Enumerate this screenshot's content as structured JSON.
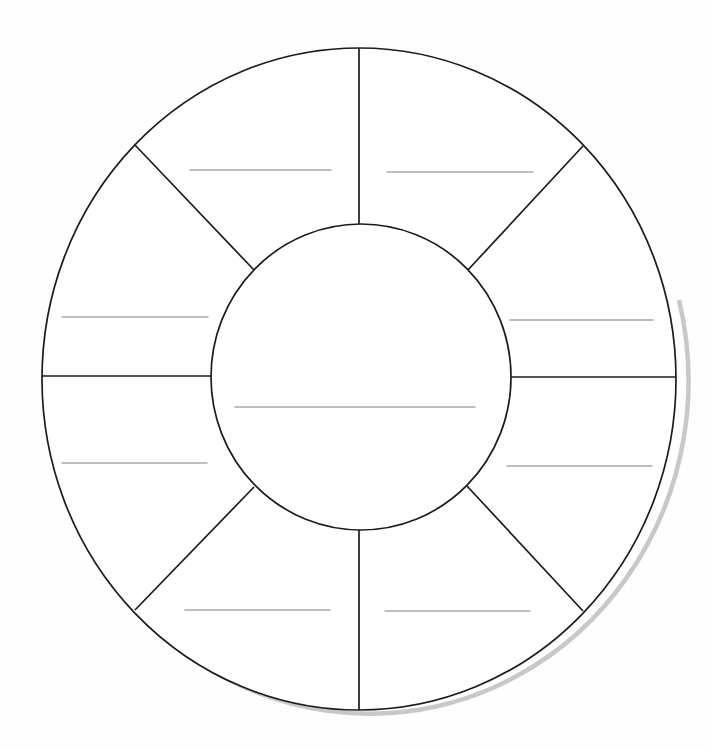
{
  "document": {
    "kind": "blank-wheel-worksheet",
    "title": "",
    "background_color": "#ffffff",
    "line_color": "#1c1c1c",
    "write_line_color": "#a9a9ad",
    "shadow_color": "#9a9a9a"
  },
  "chart_data": {
    "type": "pie",
    "title": "",
    "subtitle": "",
    "xlabel": "",
    "ylabel": "",
    "legend_position": "none",
    "grid": false,
    "note": "Blank eight-segment wheel (donut) worksheet template with a central hub; every sector is empty and carries a single ruled write-in line.",
    "categories": [
      "1",
      "2",
      "3",
      "4",
      "5",
      "6",
      "7",
      "8"
    ],
    "values": [
      12.5,
      12.5,
      12.5,
      12.5,
      12.5,
      12.5,
      12.5,
      12.5
    ],
    "labels": [
      "",
      "",
      "",
      "",
      "",
      "",
      "",
      ""
    ],
    "center_label": "",
    "segment_count": 8,
    "inner_radius_ratio": 0.47
  },
  "geometry": {
    "center": {
      "x": 359,
      "y": 379
    },
    "outer_radius": {
      "rx": 317,
      "ry": 331
    },
    "inner_radius": {
      "rx": 150,
      "ry": 153
    },
    "spoke_angles_deg": [
      90,
      45,
      0,
      315,
      270,
      225,
      180,
      135
    ]
  },
  "wheel": {
    "name": "eight-segment-wheel",
    "center_hub": {
      "name": "center-hub",
      "label": "",
      "write_line": {
        "x1": 235,
        "x2": 475,
        "y": 407
      }
    },
    "segments": [
      {
        "id": "segment-top-left",
        "label": "",
        "position": "top-left",
        "write_line": {
          "x1": 190,
          "x2": 331,
          "y": 170
        }
      },
      {
        "id": "segment-top-right",
        "label": "",
        "position": "top-right",
        "write_line": {
          "x1": 387,
          "x2": 533,
          "y": 172
        }
      },
      {
        "id": "segment-left-upper",
        "label": "",
        "position": "left-upper",
        "write_line": {
          "x1": 62,
          "x2": 208,
          "y": 317
        }
      },
      {
        "id": "segment-right-upper",
        "label": "",
        "position": "right-upper",
        "write_line": {
          "x1": 510,
          "x2": 653,
          "y": 320
        }
      },
      {
        "id": "segment-left-lower",
        "label": "",
        "position": "left-lower",
        "write_line": {
          "x1": 62,
          "x2": 207,
          "y": 463
        }
      },
      {
        "id": "segment-right-lower",
        "label": "",
        "position": "right-lower",
        "write_line": {
          "x1": 507,
          "x2": 652,
          "y": 466
        }
      },
      {
        "id": "segment-bottom-left",
        "label": "",
        "position": "bottom-left",
        "write_line": {
          "x1": 185,
          "x2": 330,
          "y": 610
        }
      },
      {
        "id": "segment-bottom-right",
        "label": "",
        "position": "bottom-right",
        "write_line": {
          "x1": 385,
          "x2": 530,
          "y": 611
        }
      }
    ]
  }
}
